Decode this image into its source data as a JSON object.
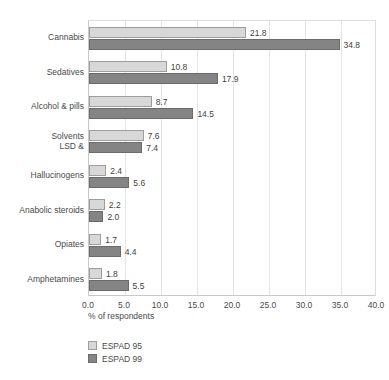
{
  "title_fragment": "",
  "chart_data": {
    "type": "bar",
    "orientation": "horizontal",
    "title": "",
    "xlabel": "% of respondents",
    "ylabel": "",
    "xlim": [
      0.0,
      40.0
    ],
    "xticks": [
      "0.0",
      "5.0",
      "10.0",
      "15.0",
      "20.0",
      "25.0",
      "30.0",
      "35.0",
      "40.0"
    ],
    "xtick_values": [
      0,
      5,
      10,
      15,
      20,
      25,
      30,
      35,
      40
    ],
    "grid": true,
    "legend_position": "bottom-left",
    "categories": [
      "Cannabis",
      "Sedatives",
      "Alcohol & pills",
      "Solvents",
      "LSD & Hallucinogens",
      "Anabolic steroids",
      "Opiates",
      "Amphetamines"
    ],
    "category_label_lines": [
      [
        "Cannabis"
      ],
      [
        "Sedatives"
      ],
      [
        "Alcohol & pills"
      ],
      [
        "Solvents",
        "LSD &"
      ],
      [
        "Hallucinogens"
      ],
      [
        "Anabolic steroids"
      ],
      [
        "Opiates"
      ],
      [
        "Amphetamines"
      ]
    ],
    "series": [
      {
        "name": "ESPAD 95",
        "color": "#d8d8d8",
        "values": [
          21.8,
          10.8,
          8.7,
          7.6,
          2.4,
          2.2,
          1.7,
          1.8
        ],
        "labels": [
          "21.8",
          "10.8",
          "8.7",
          "7.6",
          "2.4",
          "2.2",
          "1.7",
          "1.8"
        ]
      },
      {
        "name": "ESPAD 99",
        "color": "#848484",
        "values": [
          34.8,
          17.9,
          14.5,
          7.4,
          5.6,
          2.0,
          4.4,
          5.5
        ],
        "labels": [
          "34.8",
          "17.9",
          "14.5",
          "7.4",
          "5.6",
          "2.0",
          "4.4",
          "5.5"
        ]
      }
    ]
  },
  "legend": {
    "items": [
      {
        "label": "ESPAD 95",
        "color": "#d8d8d8"
      },
      {
        "label": "ESPAD 99",
        "color": "#848484"
      }
    ]
  },
  "colors": {
    "series_95": "#d8d8d8",
    "series_99": "#848484",
    "grid": "#e3e3e3",
    "axis": "#c9c9c9",
    "text": "#4a4a4a",
    "background": "#ffffff"
  }
}
